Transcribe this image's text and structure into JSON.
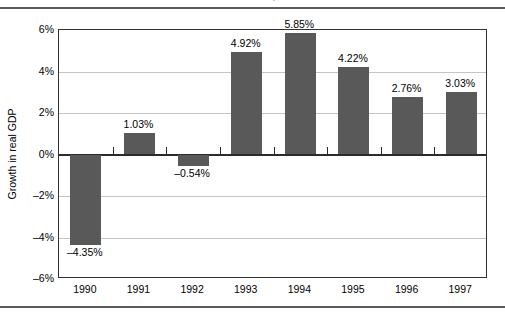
{
  "title_strip": {
    "title": "EXHIBIT 4 GDP GROWTH IN THE UNITED STATES, 1990-1997",
    "note": "clipped"
  },
  "chart_data": {
    "type": "bar",
    "title": "",
    "xlabel": "",
    "ylabel": "Growth in real GDP",
    "categories": [
      "1990",
      "1991",
      "1992",
      "1993",
      "1994",
      "1995",
      "1996",
      "1997"
    ],
    "values": [
      -4.35,
      1.03,
      -0.54,
      4.92,
      5.85,
      4.22,
      2.76,
      3.03
    ],
    "data_labels": [
      "–4.35%",
      "1.03%",
      "–0.54%",
      "4.92%",
      "5.85%",
      "4.22%",
      "2.76%",
      "3.03%"
    ],
    "ylim": [
      -6,
      6
    ],
    "yticks": [
      6,
      4,
      2,
      0,
      -2,
      -4,
      -6
    ],
    "ytick_labels": [
      "6%",
      "4%",
      "2%",
      "0%",
      "–2%",
      "–4%",
      "–6%"
    ],
    "grid": true,
    "legend": "none",
    "bar_color": "#595959",
    "grid_color": "#c4c4c4",
    "axis_color": "#333333",
    "zero_line_color": "#2b2b2b"
  }
}
